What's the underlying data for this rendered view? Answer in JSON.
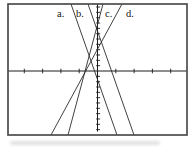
{
  "colors": {
    "background": "#ffffff",
    "frame": "#4d4d4d",
    "axis": "#1c1c1c",
    "line": "#2b2b2b",
    "text": "#161616"
  },
  "chart_data": {
    "type": "line",
    "frame_px": {
      "x": 8,
      "y": 4,
      "w": 179,
      "h": 131
    },
    "origin_px": {
      "x": 97.5,
      "y": 71
    },
    "x_tick_spacing_px": 18.3,
    "x_ticks_each_side": 4,
    "y_tick_spacing_px": 5.33,
    "y_ticks_above": 12,
    "y_ticks_below": 11,
    "y_axis_bottom_px": 131.5,
    "lines": [
      {
        "label": "a.",
        "slope_sign": "negative",
        "x1": 71,
        "y1": 4,
        "x2": 117,
        "y2": 135
      },
      {
        "label": "b.",
        "slope_sign": "negative",
        "x1": 88,
        "y1": 4,
        "x2": 134,
        "y2": 135
      },
      {
        "label": "c.",
        "slope_sign": "positive",
        "x1": 103,
        "y1": 4,
        "x2": 68,
        "y2": 135
      },
      {
        "label": "d.",
        "slope_sign": "positive",
        "x1": 122,
        "y1": 4,
        "x2": 51,
        "y2": 135
      }
    ],
    "labels": [
      {
        "text": "a."
      },
      {
        "text": "b."
      },
      {
        "text": "c."
      },
      {
        "text": "d."
      }
    ]
  }
}
